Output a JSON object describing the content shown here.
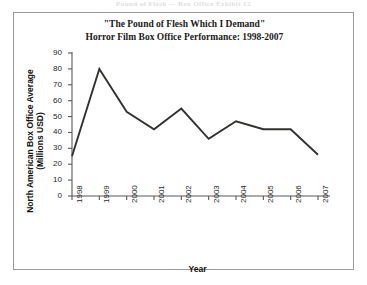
{
  "scan_header": {
    "text": "Pound of Flesh — Box Office Exhibit 12"
  },
  "figure": {
    "title_line1": "\"The Pound of Flesh Which I Demand\"",
    "title_line2": "Horror Film Box Office Performance: 1998-2007",
    "axis_color": "#58585a",
    "series_color": "#33322f",
    "frame_color": "#9a9a9a"
  },
  "ylabel_line1": "North American Box Office Average",
  "ylabel_line2": "(Millions USD)",
  "chart_data": {
    "type": "line",
    "title": "\"The Pound of Flesh Which I Demand\" Horror Film Box Office Performance: 1998-2007",
    "xlabel": "Year",
    "ylabel": "North American Box Office Average (Millions USD)",
    "categories": [
      "1998",
      "1999",
      "2000",
      "2001",
      "2002",
      "2003",
      "2004",
      "2005",
      "2006",
      "2007"
    ],
    "values": [
      25,
      80,
      53,
      42,
      55,
      36,
      47,
      42,
      42,
      26
    ],
    "series": [
      {
        "name": "North American Box Office Average",
        "values": [
          25,
          80,
          53,
          42,
          55,
          36,
          47,
          42,
          42,
          26
        ]
      }
    ],
    "ylim": [
      0,
      90
    ],
    "yticks": [
      0,
      10,
      20,
      30,
      40,
      50,
      60,
      70,
      80,
      90
    ],
    "ytick_labels": [
      "0",
      "10",
      "20",
      "30",
      "40",
      "50",
      "60",
      "70",
      "80",
      "90"
    ],
    "xtick_labels": [
      "1998",
      "1999",
      "2000",
      "2001",
      "2002",
      "2003",
      "2004",
      "2005",
      "2006",
      "2007"
    ],
    "grid": false,
    "legend": null,
    "legend_position": "none",
    "markers": false,
    "xtick_rotation": -90
  }
}
